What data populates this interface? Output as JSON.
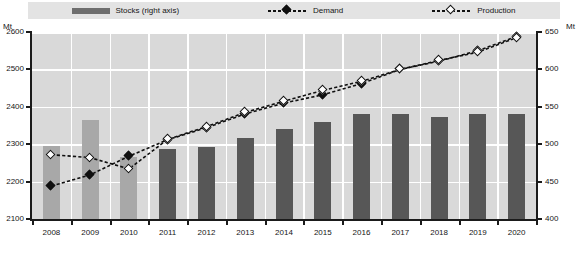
{
  "legend": {
    "items": [
      {
        "label": "Stocks (right axis)",
        "marker": "bar-swatch-icon",
        "color": "#6e6e6e"
      },
      {
        "label": "Demand",
        "marker": "filled-diamond-icon",
        "color": "#101010"
      },
      {
        "label": "Production",
        "marker": "open-diamond-icon",
        "color": "#101010"
      }
    ]
  },
  "axes": {
    "left_unit": "Mt",
    "right_unit": "Mt",
    "left_ticks": [
      "2600",
      "2500",
      "2400",
      "2300",
      "2200",
      "2100"
    ],
    "right_ticks": [
      "650",
      "600",
      "550",
      "500",
      "450",
      "400"
    ]
  },
  "footnote": {
    "text": ""
  },
  "chart_data": {
    "type": "bar",
    "title": "",
    "subtitle": "",
    "xlabel": "",
    "ylabel": "Mt",
    "y2label": "Mt",
    "ylim": [
      2100,
      2600
    ],
    "y2lim": [
      400,
      650
    ],
    "grid": true,
    "legend_position": "top",
    "categories": [
      "2008",
      "2009",
      "2010",
      "2011",
      "2012",
      "2013",
      "2014",
      "2015",
      "2016",
      "2017",
      "2018",
      "2019",
      "2020"
    ],
    "series": [
      {
        "name": "Stocks (right axis)",
        "type": "bar",
        "axis": "right",
        "unit": "Mt",
        "color": "#575757",
        "values": [
          497,
          532,
          483,
          494,
          496,
          508,
          520,
          530,
          540,
          540,
          536,
          540,
          541
        ]
      },
      {
        "name": "Demand",
        "type": "line",
        "axis": "left",
        "unit": "Mt",
        "marker": "filled-diamond",
        "color": "#101010",
        "values": [
          2188,
          2218,
          2268,
          2312,
          2344,
          2381,
          2410,
          2432,
          2462,
          2500,
          2522,
          2550,
          2588
        ]
      },
      {
        "name": "Production",
        "type": "line",
        "axis": "left",
        "unit": "Mt",
        "marker": "open-diamond",
        "color": "#101010",
        "values": [
          2272,
          2264,
          2234,
          2313,
          2347,
          2385,
          2415,
          2444,
          2468,
          2500,
          2524,
          2546,
          2585
        ]
      }
    ]
  }
}
